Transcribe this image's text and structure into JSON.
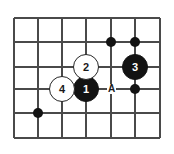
{
  "diagram": {
    "type": "go-board-problem",
    "colors": {
      "board_background": "#ffffff",
      "grid_line": "#4a4a4a",
      "black_stone": "#131313",
      "white_stone": "#ffffff",
      "stone_outline": "#262626",
      "black_label_text": "#ffffff",
      "white_label_text": "#1a1a1a"
    },
    "grid": {
      "vertical_line_x": [
        14,
        38,
        62,
        86,
        111,
        135,
        160
      ],
      "horizontal_line_y": [
        18,
        42,
        67,
        89,
        113,
        138
      ],
      "line_width": 2,
      "columns": 7,
      "rows": 6
    },
    "numbered_stones": [
      {
        "label": "1",
        "color": "black",
        "x": 86,
        "y": 89,
        "radius": 13
      },
      {
        "label": "2",
        "color": "white",
        "x": 86,
        "y": 67,
        "radius": 13
      },
      {
        "label": "3",
        "color": "black",
        "x": 135,
        "y": 67,
        "radius": 13
      },
      {
        "label": "4",
        "color": "white",
        "x": 62,
        "y": 89,
        "radius": 13
      }
    ],
    "plain_stones": [
      {
        "color": "black",
        "x": 111,
        "y": 42,
        "radius": 5
      },
      {
        "color": "black",
        "x": 135,
        "y": 42,
        "radius": 5
      },
      {
        "color": "black",
        "x": 135,
        "y": 89,
        "radius": 5
      },
      {
        "color": "black",
        "x": 38,
        "y": 113,
        "radius": 5
      }
    ],
    "point_labels": [
      {
        "label": "A",
        "x": 111,
        "y": 89
      }
    ]
  }
}
